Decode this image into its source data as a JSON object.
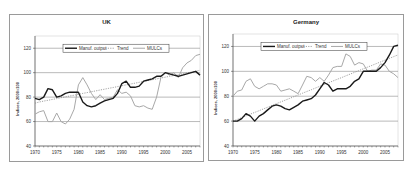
{
  "chart_data": [
    {
      "type": "line",
      "title": "UK",
      "xlabel": "",
      "ylabel": "Indices, 2000=100",
      "xlim": [
        1970,
        2008
      ],
      "ylim": [
        40,
        130
      ],
      "x_ticks": [
        1970,
        1975,
        1980,
        1985,
        1990,
        1995,
        2000,
        2005
      ],
      "y_ticks": [
        40,
        60,
        80,
        100,
        120
      ],
      "grid": true,
      "legend_position": "top-inside",
      "x": [
        1970,
        1971,
        1972,
        1973,
        1974,
        1975,
        1976,
        1977,
        1978,
        1979,
        1980,
        1981,
        1982,
        1983,
        1984,
        1985,
        1986,
        1987,
        1988,
        1989,
        1990,
        1991,
        1992,
        1993,
        1994,
        1995,
        1996,
        1997,
        1998,
        1999,
        2000,
        2001,
        2002,
        2003,
        2004,
        2005,
        2006,
        2007,
        2008
      ],
      "series": [
        {
          "name": "Manuf. output",
          "style": "solid-dark",
          "values": [
            79,
            78,
            80,
            87,
            86,
            80,
            81,
            83,
            84,
            84,
            84,
            76,
            73,
            72,
            73,
            75,
            77,
            78,
            79,
            83,
            91,
            93,
            88,
            88,
            89,
            93,
            94,
            95,
            97,
            97,
            100,
            99,
            98,
            97,
            98,
            99,
            100,
            101,
            98
          ]
        },
        {
          "name": "Trend",
          "style": "dotted",
          "values": [
            75,
            76,
            76.7,
            77.4,
            78.1,
            78.8,
            79.5,
            80.2,
            80.9,
            81.6,
            82.3,
            83,
            83.7,
            84.4,
            85.1,
            85.8,
            86.5,
            87.2,
            87.9,
            88.6,
            89.3,
            90,
            90.7,
            91.4,
            92.1,
            92.8,
            93.5,
            94.2,
            94.9,
            95.6,
            96.3,
            97,
            97.7,
            98.4,
            99.1,
            99.8,
            100.5,
            101.2,
            101.9
          ]
        },
        {
          "name": "MULCs",
          "style": "solid-light",
          "values": [
            66,
            68,
            69,
            60,
            60,
            67,
            60,
            58,
            62,
            70,
            90,
            96,
            90,
            83,
            78,
            82,
            78,
            79,
            80,
            86,
            83,
            84,
            81,
            73,
            72,
            73,
            71,
            70,
            80,
            96,
            100,
            98,
            100,
            96,
            104,
            108,
            110,
            114,
            115
          ]
        }
      ]
    },
    {
      "type": "line",
      "title": "Germany",
      "xlabel": "",
      "ylabel": "Indices, 2000=100",
      "xlim": [
        1970,
        2008
      ],
      "ylim": [
        40,
        130
      ],
      "x_ticks": [
        1970,
        1975,
        1980,
        1985,
        1990,
        1995,
        2000,
        2005
      ],
      "y_ticks": [
        40,
        60,
        80,
        100,
        120
      ],
      "grid": true,
      "legend_position": "top-inside",
      "x": [
        1970,
        1971,
        1972,
        1973,
        1974,
        1975,
        1976,
        1977,
        1978,
        1979,
        1980,
        1981,
        1982,
        1983,
        1984,
        1985,
        1986,
        1987,
        1988,
        1989,
        1990,
        1991,
        1992,
        1993,
        1994,
        1995,
        1996,
        1997,
        1998,
        1999,
        2000,
        2001,
        2002,
        2003,
        2004,
        2005,
        2006,
        2007,
        2008
      ],
      "series": [
        {
          "name": "Manuf. output",
          "style": "solid-dark",
          "values": [
            60,
            60,
            62,
            66,
            64,
            60,
            64,
            66,
            69,
            72,
            73,
            72,
            70,
            69,
            71,
            73,
            76,
            77,
            78,
            81,
            86,
            91,
            89,
            84,
            86,
            86,
            86,
            88,
            92,
            94,
            100,
            100,
            100,
            100,
            103,
            107,
            113,
            120,
            121
          ]
        },
        {
          "name": "Trend",
          "style": "dotted",
          "values": [
            60,
            61.4,
            62.8,
            64.2,
            65.6,
            67,
            68.4,
            69.8,
            71.2,
            72.6,
            74,
            75.4,
            76.8,
            78.2,
            79.6,
            81,
            82.4,
            83.8,
            85.2,
            86.6,
            88,
            89.4,
            90.8,
            92.2,
            93.6,
            95,
            96.4,
            97.8,
            99.2,
            100.6,
            102,
            103.4,
            104.8,
            106.2,
            107.6,
            109,
            110.4,
            111.8,
            113.2
          ]
        },
        {
          "name": "MULCs",
          "style": "solid-light",
          "values": [
            80,
            84,
            85,
            92,
            94,
            88,
            86,
            88,
            90,
            90,
            89,
            84,
            85,
            86,
            84,
            82,
            89,
            96,
            95,
            92,
            95,
            92,
            97,
            103,
            104,
            104,
            114,
            112,
            105,
            107,
            106,
            100,
            101,
            101,
            106,
            105,
            100,
            98,
            95
          ]
        }
      ]
    }
  ],
  "panels": [
    {
      "title": "UK"
    },
    {
      "title": "Germany"
    }
  ],
  "colors": {
    "manuf_output": "#1a1a1a",
    "trend": "#8a8a8a",
    "mulcs": "#a8a8a8",
    "grid": "#8c8c8c",
    "border": "#9a9a9a"
  }
}
